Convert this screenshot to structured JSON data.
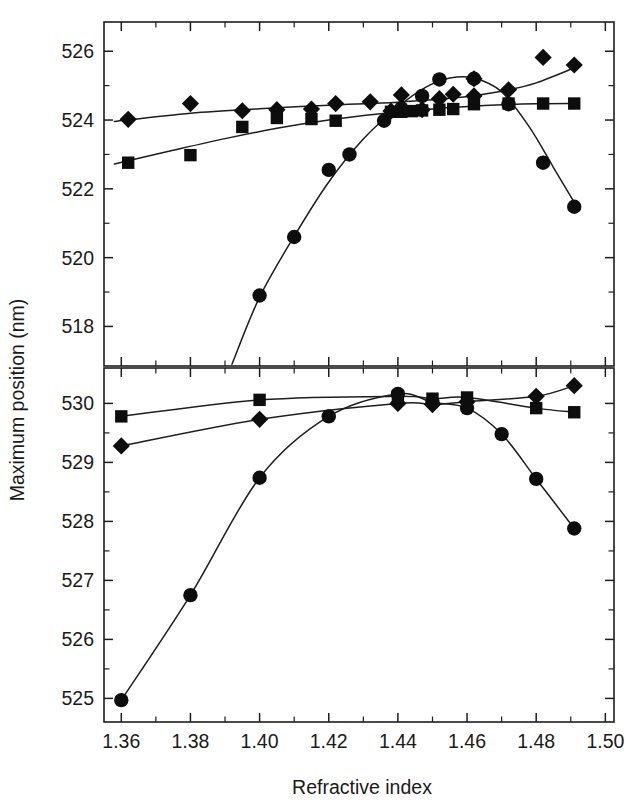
{
  "figure": {
    "background_color": "#ffffff",
    "ink_color": "#1a1a1a",
    "xlabel": "Refractive index",
    "ylabel": "Maximum position (nm)"
  },
  "chart_data": {
    "type": "scatter",
    "title": "",
    "xlabel": "Refractive index",
    "ylabel": "Maximum position (nm)",
    "grid": false,
    "legend": "none",
    "shared_x": true,
    "panels": [
      {
        "name": "top-panel",
        "xlim": [
          1.355,
          1.5025
        ],
        "ylim": [
          516.85,
          526.85
        ],
        "xticks": [
          1.36,
          1.38,
          1.4,
          1.42,
          1.44,
          1.46,
          1.48,
          1.5
        ],
        "xtick_labels": [
          "",
          "",
          "",
          "",
          "",
          "",
          "",
          ""
        ],
        "xminor_step": 0.01,
        "yticks": [
          518,
          520,
          522,
          524,
          526
        ],
        "ytick_labels": [
          "518",
          "520",
          "522",
          "524",
          "526"
        ],
        "yminor": [
          519,
          521,
          523,
          525
        ],
        "series": [
          {
            "name": "series-diamond",
            "marker": "diamond",
            "points": [
              {
                "x": 1.362,
                "y": 524.02
              },
              {
                "x": 1.38,
                "y": 524.48
              },
              {
                "x": 1.395,
                "y": 524.27
              },
              {
                "x": 1.405,
                "y": 524.3
              },
              {
                "x": 1.415,
                "y": 524.32
              },
              {
                "x": 1.422,
                "y": 524.48
              },
              {
                "x": 1.432,
                "y": 524.53
              },
              {
                "x": 1.438,
                "y": 524.26
              },
              {
                "x": 1.441,
                "y": 524.73
              },
              {
                "x": 1.447,
                "y": 524.3
              },
              {
                "x": 1.452,
                "y": 524.62
              },
              {
                "x": 1.456,
                "y": 524.75
              },
              {
                "x": 1.462,
                "y": 524.7
              },
              {
                "x": 1.462,
                "y": 525.2
              },
              {
                "x": 1.472,
                "y": 524.88
              },
              {
                "x": 1.482,
                "y": 525.82
              },
              {
                "x": 1.491,
                "y": 525.6
              }
            ],
            "fit": [
              {
                "x": 1.358,
                "y": 523.96
              },
              {
                "x": 1.38,
                "y": 524.2
              },
              {
                "x": 1.4,
                "y": 524.33
              },
              {
                "x": 1.42,
                "y": 524.43
              },
              {
                "x": 1.44,
                "y": 524.52
              },
              {
                "x": 1.455,
                "y": 524.63
              },
              {
                "x": 1.47,
                "y": 524.84
              },
              {
                "x": 1.48,
                "y": 525.08
              },
              {
                "x": 1.492,
                "y": 525.56
              }
            ]
          },
          {
            "name": "series-square",
            "marker": "square",
            "points": [
              {
                "x": 1.362,
                "y": 522.76
              },
              {
                "x": 1.38,
                "y": 522.98
              },
              {
                "x": 1.395,
                "y": 523.8
              },
              {
                "x": 1.405,
                "y": 524.06
              },
              {
                "x": 1.415,
                "y": 524.03
              },
              {
                "x": 1.422,
                "y": 523.98
              },
              {
                "x": 1.438,
                "y": 524.24
              },
              {
                "x": 1.441,
                "y": 524.24
              },
              {
                "x": 1.444,
                "y": 524.26
              },
              {
                "x": 1.447,
                "y": 524.28
              },
              {
                "x": 1.452,
                "y": 524.3
              },
              {
                "x": 1.456,
                "y": 524.32
              },
              {
                "x": 1.462,
                "y": 524.46
              },
              {
                "x": 1.472,
                "y": 524.48
              },
              {
                "x": 1.482,
                "y": 524.48
              },
              {
                "x": 1.491,
                "y": 524.48
              }
            ],
            "fit": [
              {
                "x": 1.358,
                "y": 522.72
              },
              {
                "x": 1.375,
                "y": 523.12
              },
              {
                "x": 1.39,
                "y": 523.46
              },
              {
                "x": 1.405,
                "y": 523.76
              },
              {
                "x": 1.42,
                "y": 524.0
              },
              {
                "x": 1.435,
                "y": 524.18
              },
              {
                "x": 1.45,
                "y": 524.32
              },
              {
                "x": 1.465,
                "y": 524.42
              },
              {
                "x": 1.48,
                "y": 524.47
              },
              {
                "x": 1.492,
                "y": 524.48
              }
            ]
          },
          {
            "name": "series-circle",
            "marker": "circle",
            "points": [
              {
                "x": 1.4,
                "y": 518.9
              },
              {
                "x": 1.41,
                "y": 520.6
              },
              {
                "x": 1.42,
                "y": 522.55
              },
              {
                "x": 1.426,
                "y": 523.0
              },
              {
                "x": 1.436,
                "y": 523.98
              },
              {
                "x": 1.441,
                "y": 524.34
              },
              {
                "x": 1.447,
                "y": 524.7
              },
              {
                "x": 1.452,
                "y": 525.18
              },
              {
                "x": 1.462,
                "y": 525.2
              },
              {
                "x": 1.472,
                "y": 524.46
              },
              {
                "x": 1.482,
                "y": 522.76
              },
              {
                "x": 1.491,
                "y": 521.48
              }
            ],
            "fit": [
              {
                "x": 1.392,
                "y": 516.9
              },
              {
                "x": 1.4,
                "y": 518.85
              },
              {
                "x": 1.41,
                "y": 520.62
              },
              {
                "x": 1.42,
                "y": 522.2
              },
              {
                "x": 1.43,
                "y": 523.45
              },
              {
                "x": 1.44,
                "y": 524.38
              },
              {
                "x": 1.448,
                "y": 524.95
              },
              {
                "x": 1.455,
                "y": 525.22
              },
              {
                "x": 1.462,
                "y": 525.22
              },
              {
                "x": 1.47,
                "y": 524.82
              },
              {
                "x": 1.478,
                "y": 523.8
              },
              {
                "x": 1.485,
                "y": 522.62
              },
              {
                "x": 1.492,
                "y": 521.44
              }
            ]
          }
        ]
      },
      {
        "name": "bottom-panel",
        "xlim": [
          1.355,
          1.5025
        ],
        "ylim": [
          524.6,
          530.6
        ],
        "xticks": [
          1.36,
          1.38,
          1.4,
          1.42,
          1.44,
          1.46,
          1.48,
          1.5
        ],
        "xtick_labels": [
          "1.36",
          "1.38",
          "1.40",
          "1.42",
          "1.44",
          "1.46",
          "1.48",
          "1.50"
        ],
        "xminor_step": 0.01,
        "yticks": [
          525,
          526,
          527,
          528,
          529,
          530
        ],
        "ytick_labels": [
          "525",
          "526",
          "527",
          "528",
          "529",
          "530"
        ],
        "yminor": [
          525.5,
          526.5,
          527.5,
          528.5,
          529.5
        ],
        "series": [
          {
            "name": "series-diamond",
            "marker": "diamond",
            "points": [
              {
                "x": 1.36,
                "y": 529.28
              },
              {
                "x": 1.4,
                "y": 529.73
              },
              {
                "x": 1.44,
                "y": 530.0
              },
              {
                "x": 1.45,
                "y": 529.98
              },
              {
                "x": 1.46,
                "y": 530.03
              },
              {
                "x": 1.48,
                "y": 530.12
              },
              {
                "x": 1.491,
                "y": 530.3
              }
            ],
            "fit": [
              {
                "x": 1.36,
                "y": 529.28
              },
              {
                "x": 1.4,
                "y": 529.73
              },
              {
                "x": 1.44,
                "y": 530.0
              },
              {
                "x": 1.45,
                "y": 529.98
              },
              {
                "x": 1.46,
                "y": 530.03
              },
              {
                "x": 1.48,
                "y": 530.12
              },
              {
                "x": 1.491,
                "y": 530.3
              }
            ]
          },
          {
            "name": "series-square",
            "marker": "square",
            "points": [
              {
                "x": 1.36,
                "y": 529.78
              },
              {
                "x": 1.4,
                "y": 530.06
              },
              {
                "x": 1.44,
                "y": 530.12
              },
              {
                "x": 1.45,
                "y": 530.08
              },
              {
                "x": 1.46,
                "y": 530.1
              },
              {
                "x": 1.48,
                "y": 529.92
              },
              {
                "x": 1.491,
                "y": 529.85
              }
            ],
            "fit": [
              {
                "x": 1.36,
                "y": 529.78
              },
              {
                "x": 1.4,
                "y": 530.06
              },
              {
                "x": 1.44,
                "y": 530.12
              },
              {
                "x": 1.45,
                "y": 530.08
              },
              {
                "x": 1.46,
                "y": 530.1
              },
              {
                "x": 1.48,
                "y": 529.92
              },
              {
                "x": 1.491,
                "y": 529.85
              }
            ]
          },
          {
            "name": "series-circle",
            "marker": "circle",
            "points": [
              {
                "x": 1.36,
                "y": 524.97
              },
              {
                "x": 1.38,
                "y": 526.75
              },
              {
                "x": 1.4,
                "y": 528.74
              },
              {
                "x": 1.42,
                "y": 529.78
              },
              {
                "x": 1.44,
                "y": 530.16
              },
              {
                "x": 1.45,
                "y": 530.02
              },
              {
                "x": 1.46,
                "y": 529.92
              },
              {
                "x": 1.47,
                "y": 529.48
              },
              {
                "x": 1.48,
                "y": 528.72
              },
              {
                "x": 1.491,
                "y": 527.88
              }
            ],
            "fit": [
              {
                "x": 1.36,
                "y": 524.97
              },
              {
                "x": 1.38,
                "y": 526.75
              },
              {
                "x": 1.4,
                "y": 528.74
              },
              {
                "x": 1.42,
                "y": 529.78
              },
              {
                "x": 1.44,
                "y": 530.16
              },
              {
                "x": 1.45,
                "y": 530.02
              },
              {
                "x": 1.46,
                "y": 529.92
              },
              {
                "x": 1.47,
                "y": 529.48
              },
              {
                "x": 1.48,
                "y": 528.72
              },
              {
                "x": 1.491,
                "y": 527.88
              }
            ]
          }
        ]
      }
    ]
  }
}
